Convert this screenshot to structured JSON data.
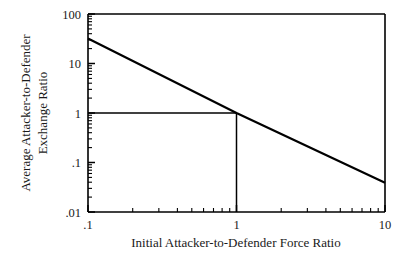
{
  "chart_data": {
    "type": "line",
    "title": "",
    "subtitle": "",
    "xlabel": "Initial Attacker-to-Defender Force Ratio",
    "ylabel_line1": "Average Attacker-to-Defender",
    "ylabel_line2": "Exchange Ratio",
    "xscale": "log",
    "yscale": "log",
    "xlim": [
      0.1,
      10
    ],
    "ylim": [
      0.01,
      100
    ],
    "grid": false,
    "legend": "none",
    "xticks": [
      {
        "value": 0.1,
        "label": ".1"
      },
      {
        "value": 1,
        "label": "1"
      },
      {
        "value": 10,
        "label": "10"
      }
    ],
    "yticks": [
      {
        "value": 100,
        "label": "100"
      },
      {
        "value": 10,
        "label": "10"
      },
      {
        "value": 1,
        "label": "1"
      },
      {
        "value": 0.1,
        "label": ".1"
      },
      {
        "value": 0.01,
        "label": ".01"
      }
    ],
    "series": [
      {
        "name": "exchange-ratio-curve",
        "color": "#000000",
        "x": [
          0.1,
          1,
          10
        ],
        "y": [
          32,
          1,
          0.039
        ]
      }
    ],
    "annotations": [
      {
        "name": "reference-lines",
        "type": "crosshair",
        "x": 1,
        "y": 1,
        "horizontal_from_x": 0.1,
        "vertical_to_y": 0.01,
        "color": "#000000"
      }
    ]
  }
}
